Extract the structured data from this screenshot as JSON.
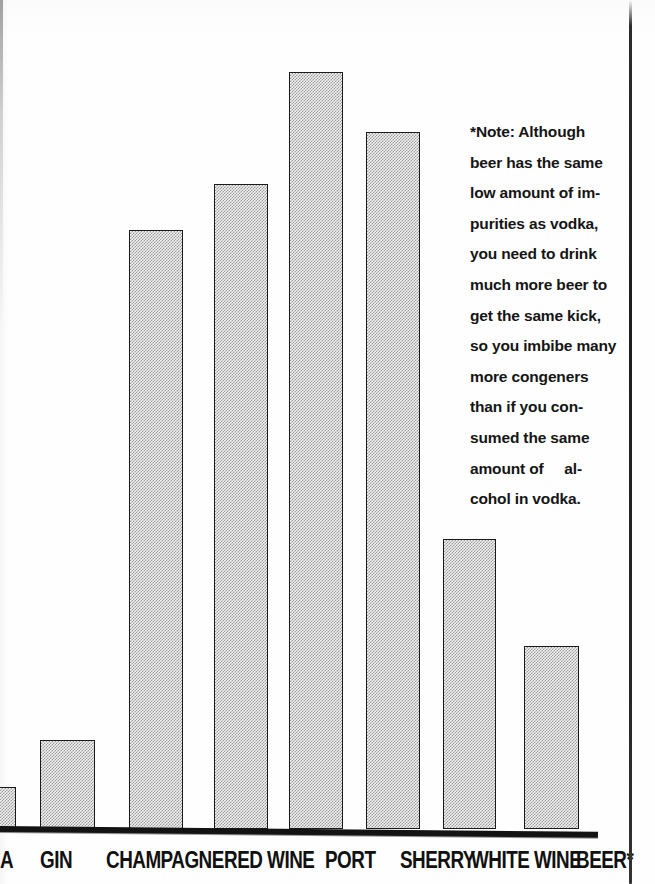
{
  "document": {
    "kind": "scanned-book-page-figure",
    "note_marker": "*"
  },
  "chart_data": {
    "type": "bar",
    "title": "",
    "subtitle": "",
    "xlabel": "",
    "ylabel": "",
    "grid": false,
    "legend": null,
    "axis": {
      "x_visible": true,
      "y_visible": false,
      "baseline_note": "thick black horizontal rule at bottom of plot"
    },
    "categories": [
      "VODKA",
      "GIN",
      "CHAMPAGNE",
      "RED WINE",
      "PORT",
      "SHERRY",
      "WHITE WINE",
      "BEER*"
    ],
    "values": [
      5,
      12,
      78,
      89,
      100,
      94,
      39,
      24
    ],
    "ylim": [
      0,
      100
    ],
    "value_units": "relative congener / impurity content (unlabeled scale)"
  },
  "bars": [
    {
      "label": "VODKA",
      "label_visible": "A",
      "x": -34,
      "width": 50,
      "top": 787,
      "clipped_left": true
    },
    {
      "label": "GIN",
      "label_visible": "GIN",
      "x": 40,
      "width": 55,
      "top": 740,
      "clipped_left": false
    },
    {
      "label": "CHAMPAGNE",
      "label_visible": "CHAMPAGNE",
      "x": 129,
      "width": 54,
      "top": 230,
      "clipped_left": false
    },
    {
      "label": "RED WINE",
      "label_visible": "RED WINE",
      "x": 214,
      "width": 54,
      "top": 184,
      "clipped_left": false
    },
    {
      "label": "PORT",
      "label_visible": "PORT",
      "x": 289,
      "width": 54,
      "top": 72,
      "clipped_left": false
    },
    {
      "label": "SHERRY",
      "label_visible": "SHERRY",
      "x": 366,
      "width": 54,
      "top": 132,
      "clipped_left": false
    },
    {
      "label": "WHITE WINE",
      "label_visible": "WHITE WINE",
      "x": 443,
      "width": 53,
      "top": 539,
      "clipped_left": false
    },
    {
      "label": "BEER*",
      "label_visible": "BEER*",
      "x": 524,
      "width": 55,
      "top": 646,
      "clipped_left": false
    }
  ],
  "x_tick_labels": [
    {
      "text": "A",
      "x": 0
    },
    {
      "text": "GIN",
      "x": 40
    },
    {
      "text": "CHAMPAGNE",
      "x": 106
    },
    {
      "text": "RED WINE",
      "x": 224
    },
    {
      "text": "PORT",
      "x": 325
    },
    {
      "text": "SHERRY",
      "x": 400
    },
    {
      "text": "WHITE WINE",
      "x": 471
    },
    {
      "text": "BEER*",
      "x": 576
    }
  ],
  "note": {
    "full_text": "*Note: Although beer has the same low amount of impurities as vodka, you need to drink much more beer to get the same kick, so you imbibe many more congeners than if you consumed the same amount of alcohol in vodka.",
    "lines": [
      "*Note: Although",
      "beer has the same",
      "low amount of im-",
      "purities as vodka,",
      "you need to drink",
      "much more beer to",
      "get the same kick,",
      "so you imbibe many",
      "more congeners",
      "than if you con-",
      "sumed the same",
      "amount of     al-",
      "cohol in vodka."
    ]
  },
  "colors": {
    "ink": "#141414",
    "bar_fill_light": "#f2f2f2",
    "bar_dither_dark": "#9a9a9a",
    "bar_border": "#1a1a1a",
    "paper": "#fefefe"
  }
}
